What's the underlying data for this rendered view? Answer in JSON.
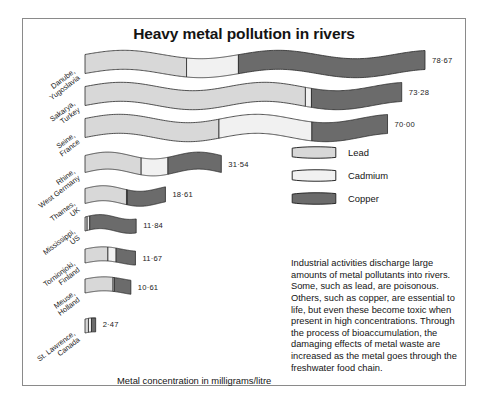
{
  "title": "Heavy metal pollution in rivers",
  "caption": "Metal concentration in milligrams/litre",
  "colors": {
    "lead": "#d8d8d8",
    "cadmium": "#f1f1f1",
    "copper": "#6b6b6b",
    "outline": "#2a2a2a",
    "border": "#8a8a8a",
    "text": "#141414"
  },
  "legend": {
    "items": [
      {
        "label": "Lead",
        "key": "lead"
      },
      {
        "label": "Cadmium",
        "key": "cadmium"
      },
      {
        "label": "Copper",
        "key": "copper"
      }
    ]
  },
  "blurb": "Industrial activities discharge large amounts of metal pollutants into rivers. Some, such as lead, are poisonous. Others, such as copper, are essential to life, but even these become toxic when present in high concentrations. Through the process of bioaccumulation, the damaging effects of metal waste are increased as the metal goes through the freshwater food chain.",
  "chart_data": {
    "type": "bar",
    "title": "Heavy metal pollution in rivers",
    "xlabel": "Metal concentration in milligrams/litre",
    "ylabel": "",
    "unit": "mg/litre",
    "orientation": "horizontal",
    "stacked": true,
    "grid": false,
    "legend_position": "right",
    "series": [
      {
        "name": "Lead",
        "values": [
          23.5,
          51.0,
          31.0,
          13.0,
          9.6,
          0.5,
          5.3,
          6.5,
          0.8
        ]
      },
      {
        "name": "Cadmium",
        "values": [
          12.0,
          1.4,
          21.5,
          6.2,
          0.2,
          0.6,
          1.9,
          0.3,
          0.7
        ]
      },
      {
        "name": "Copper",
        "values": [
          43.17,
          20.88,
          17.5,
          12.34,
          8.81,
          10.74,
          4.47,
          3.81,
          0.97
        ]
      }
    ],
    "categories": [
      "Danube, Yugoslavia",
      "Sakarya, Turkey",
      "Seine, France",
      "Rhine, West Germany",
      "Thames, UK",
      "Mississippi, US",
      "Tornionjoki, Finland",
      "Meuse, Holland",
      "St. Lawrence, Canada"
    ],
    "totals": [
      78.67,
      73.28,
      70.0,
      31.54,
      18.61,
      11.84,
      11.67,
      10.61,
      2.47
    ],
    "total_labels": [
      "78·67",
      "73·28",
      "70·00",
      "31·54",
      "18·61",
      "11·84",
      "11·67",
      "10·61",
      "2·47"
    ]
  },
  "rivers": [
    {
      "name_line1": "Danube,",
      "name_line2": "Yugoslavia",
      "value_label": "78·67"
    },
    {
      "name_line1": "Sakarya,",
      "name_line2": "Turkey",
      "value_label": "73·28"
    },
    {
      "name_line1": "Seine,",
      "name_line2": "France",
      "value_label": "70·00"
    },
    {
      "name_line1": "Rhine,",
      "name_line2": "West Germany",
      "value_label": "31·54"
    },
    {
      "name_line1": "Thames,",
      "name_line2": "UK",
      "value_label": "18·61"
    },
    {
      "name_line1": "Mississippi,",
      "name_line2": "US",
      "value_label": "11·84"
    },
    {
      "name_line1": "Tornionjoki,",
      "name_line2": "Finland",
      "value_label": "11·67"
    },
    {
      "name_line1": "Meuse,",
      "name_line2": "Holland",
      "value_label": "10·61"
    },
    {
      "name_line1": "St. Lawrence,",
      "name_line2": "Canada",
      "value_label": "2·47"
    }
  ]
}
